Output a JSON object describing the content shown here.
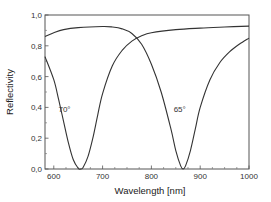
{
  "chart_data": {
    "type": "line",
    "title": "",
    "xlabel": "Wavelength [nm]",
    "ylabel": "Reflectivity",
    "xlim": [
      582,
      1000
    ],
    "ylim": [
      0.0,
      1.0
    ],
    "grid": false,
    "legend": null,
    "x_ticks": [
      600,
      700,
      800,
      900,
      1000
    ],
    "x_tick_labels": [
      "600",
      "700",
      "800",
      "900",
      "1000"
    ],
    "y_ticks": [
      0.0,
      0.2,
      0.4,
      0.6,
      0.8,
      1.0
    ],
    "y_tick_labels": [
      "0,0",
      "0,2",
      "0,4",
      "0,6",
      "0,8",
      "1,0"
    ],
    "annotations": [
      {
        "text": "70°",
        "x": 622,
        "y": 0.37
      },
      {
        "text": "65°",
        "x": 858,
        "y": 0.37
      }
    ],
    "series": [
      {
        "name": "70°",
        "x": [
          582,
          600,
          610,
          620,
          630,
          640,
          650,
          655,
          660,
          670,
          680,
          690,
          700,
          720,
          740,
          760,
          780,
          800,
          850,
          900,
          950,
          1000
        ],
        "y": [
          0.73,
          0.58,
          0.45,
          0.31,
          0.17,
          0.06,
          0.005,
          0.0,
          0.01,
          0.08,
          0.2,
          0.35,
          0.49,
          0.67,
          0.77,
          0.83,
          0.865,
          0.885,
          0.905,
          0.915,
          0.922,
          0.928
        ]
      },
      {
        "name": "65°",
        "x": [
          582,
          600,
          620,
          650,
          700,
          720,
          740,
          760,
          780,
          800,
          820,
          840,
          850,
          860,
          865,
          870,
          880,
          890,
          900,
          920,
          940,
          960,
          980,
          1000
        ],
        "y": [
          0.86,
          0.885,
          0.905,
          0.918,
          0.925,
          0.922,
          0.91,
          0.88,
          0.81,
          0.68,
          0.5,
          0.26,
          0.12,
          0.02,
          0.0,
          0.02,
          0.12,
          0.26,
          0.4,
          0.58,
          0.69,
          0.76,
          0.81,
          0.85
        ]
      }
    ]
  }
}
